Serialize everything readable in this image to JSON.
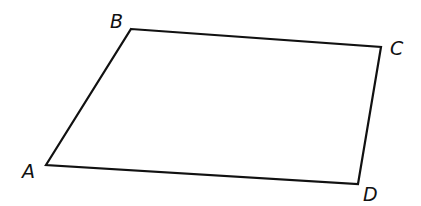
{
  "diagram": {
    "type": "quadrilateral",
    "stroke_color": "#111111",
    "background": "#ffffff",
    "vertices": [
      {
        "label": "A",
        "x": 46,
        "y": 165,
        "label_x": 22,
        "label_y": 178
      },
      {
        "label": "B",
        "x": 131,
        "y": 29,
        "label_x": 110,
        "label_y": 28
      },
      {
        "label": "C",
        "x": 381,
        "y": 47,
        "label_x": 390,
        "label_y": 55
      },
      {
        "label": "D",
        "x": 358,
        "y": 184,
        "label_x": 363,
        "label_y": 201
      }
    ]
  }
}
